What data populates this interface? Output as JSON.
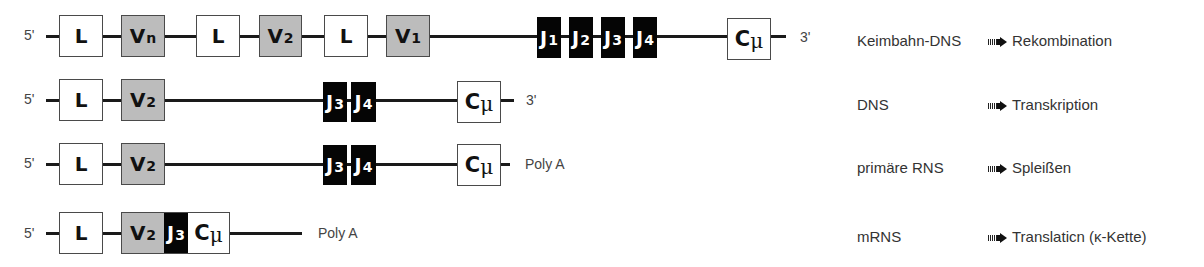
{
  "colors": {
    "leader_exon_fill": "#ffffff",
    "v_segment_fill": "#bcbcbc",
    "j_segment_fill": "#050505",
    "constant_fill": "#ffffff",
    "strand_line": "#1a1a1a"
  },
  "rows": [
    {
      "five_prime": "5'",
      "three_prime": "3'",
      "segments": [
        {
          "type": "L",
          "main": "L",
          "sub": ""
        },
        {
          "type": "V",
          "main": "V",
          "sub": "n"
        },
        {
          "type": "L",
          "main": "L",
          "sub": ""
        },
        {
          "type": "V",
          "main": "V",
          "sub": "2"
        },
        {
          "type": "L",
          "main": "L",
          "sub": ""
        },
        {
          "type": "V",
          "main": "V",
          "sub": "1"
        },
        {
          "type": "J",
          "main": "J",
          "sub": "1"
        },
        {
          "type": "J",
          "main": "J",
          "sub": "2"
        },
        {
          "type": "J",
          "main": "J",
          "sub": "3"
        },
        {
          "type": "J",
          "main": "J",
          "sub": "4"
        },
        {
          "type": "C",
          "main": "C",
          "sub": "μ"
        }
      ],
      "stage": "Keimbahn-DNS",
      "action": "Rekombination"
    },
    {
      "five_prime": "5'",
      "three_prime": "3'",
      "segments": [
        {
          "type": "L",
          "main": "L",
          "sub": ""
        },
        {
          "type": "V",
          "main": "V",
          "sub": "2"
        },
        {
          "type": "J",
          "main": "J",
          "sub": "3"
        },
        {
          "type": "J",
          "main": "J",
          "sub": "4"
        },
        {
          "type": "C",
          "main": "C",
          "sub": "μ"
        }
      ],
      "stage": "DNS",
      "action": "Transkription"
    },
    {
      "five_prime": "5'",
      "three_prime": "Poly A",
      "segments": [
        {
          "type": "L",
          "main": "L",
          "sub": ""
        },
        {
          "type": "V",
          "main": "V",
          "sub": "2"
        },
        {
          "type": "J",
          "main": "J",
          "sub": "3"
        },
        {
          "type": "J",
          "main": "J",
          "sub": "4"
        },
        {
          "type": "C",
          "main": "C",
          "sub": "μ"
        }
      ],
      "stage": "primäre RNS",
      "action": "Spleißen"
    },
    {
      "five_prime": "5'",
      "three_prime": "Poly A",
      "segments": [
        {
          "type": "L",
          "main": "L",
          "sub": ""
        },
        {
          "type": "V",
          "main": "V",
          "sub": "2"
        },
        {
          "type": "J",
          "main": "J",
          "sub": "3"
        },
        {
          "type": "C",
          "main": "C",
          "sub": "μ"
        }
      ],
      "stage": "mRNS",
      "action": "Translaticn (κ-Kette)"
    }
  ],
  "arrow_icon": "striped-right-arrow"
}
